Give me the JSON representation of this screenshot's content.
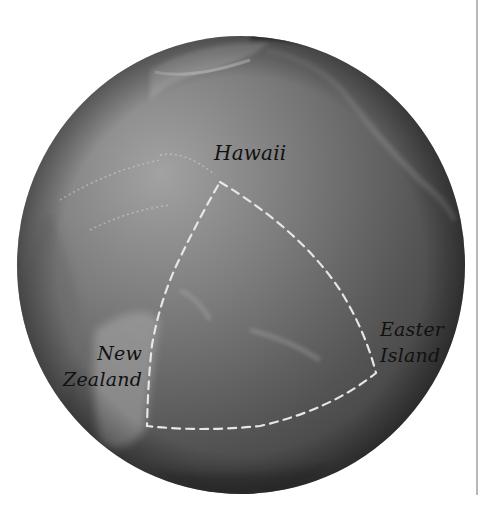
{
  "map": {
    "type": "globe",
    "region": "Pacific Ocean",
    "style": "grayscale relief globe",
    "colors": {
      "background": "#ffffff",
      "ocean_light": "#9a9a9a",
      "ocean_dark": "#3a3a3a",
      "route_line": "#e6e6e6",
      "label_text": "#111111",
      "side_rule": "#b8b8b8"
    },
    "labels": {
      "hawaii": "Hawaii",
      "easter_island": [
        "Easter",
        "Island"
      ],
      "new_zealand": [
        "New",
        "Zealand"
      ]
    },
    "triangle": {
      "description": "Polynesian Triangle (dashed outline)",
      "vertices": [
        "Hawaii",
        "Easter Island",
        "New Zealand"
      ],
      "line_style": "dashed"
    }
  }
}
